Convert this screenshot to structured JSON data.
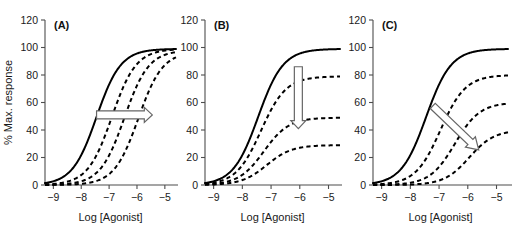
{
  "figure": {
    "background": "#ffffff",
    "curve_color": "#000000",
    "axis_color": "#4d4d4d",
    "arrow_color": "#666666",
    "width": 512,
    "height": 230
  },
  "axes": {
    "ylabel": "% Max. response",
    "xlabel": "Log [Agonist]",
    "yticks": [
      0,
      20,
      40,
      60,
      80,
      100,
      120
    ],
    "xticks": [
      -9,
      -8,
      -7,
      -6,
      -5
    ],
    "xticklabels": [
      "−9",
      "−8",
      "−7",
      "−6",
      "−5"
    ],
    "ylim": [
      0,
      120
    ],
    "xlim": [
      -9.3,
      -4.6
    ],
    "grid": false
  },
  "panels": [
    {
      "label": "(A)",
      "name": "panel-a-competitive-antagonism",
      "show_ylabel": true,
      "arrow": "right",
      "arrow_name": "rightward-shift-arrow"
    },
    {
      "label": "(B)",
      "name": "panel-b-noncompetitive-antagonism",
      "show_ylabel": false,
      "arrow": "down",
      "arrow_name": "downward-depression-arrow"
    },
    {
      "label": "(C)",
      "name": "panel-c-mixed-antagonism",
      "show_ylabel": false,
      "arrow": "diagonal",
      "arrow_name": "diagonal-shift-depression-arrow"
    }
  ],
  "chart_data": {
    "type": "line",
    "title": "",
    "xlabel": "Log [Agonist]",
    "ylabel": "% Max. response",
    "xlim": [
      -9.3,
      -4.6
    ],
    "ylim": [
      0,
      120
    ],
    "xticks": [
      -9,
      -8,
      -7,
      -6,
      -5
    ],
    "yticks": [
      0,
      20,
      40,
      60,
      80,
      100,
      120
    ],
    "grid": false,
    "legend": "none",
    "panels": [
      {
        "panel": "(A)",
        "description": "Parallel rightward shift of concentration-response curves with no change in maximum response",
        "annotation_arrow": "horizontal rightward arrow at 50% response from log -7.5 to log -5.4",
        "series": [
          {
            "name": "control",
            "style": "solid",
            "logEC50": -7.45,
            "emax": 99,
            "hill": 1.0
          },
          {
            "name": "antagonist 1",
            "style": "dashed",
            "logEC50": -6.9,
            "emax": 99,
            "hill": 1.0
          },
          {
            "name": "antagonist 2",
            "style": "dashed",
            "logEC50": -6.45,
            "emax": 98,
            "hill": 1.0
          },
          {
            "name": "antagonist 3",
            "style": "dashed",
            "logEC50": -5.95,
            "emax": 97,
            "hill": 1.0
          }
        ]
      },
      {
        "panel": "(B)",
        "description": "Progressive depression of maximum response with no shift in EC50",
        "annotation_arrow": "vertical downward arrow at log -6 from 86% to 42% response",
        "series": [
          {
            "name": "control",
            "style": "solid",
            "logEC50": -7.45,
            "emax": 99,
            "hill": 1.0
          },
          {
            "name": "antagonist 1",
            "style": "dashed",
            "logEC50": -7.35,
            "emax": 79,
            "hill": 1.0
          },
          {
            "name": "antagonist 2",
            "style": "dashed",
            "logEC50": -7.25,
            "emax": 49,
            "hill": 1.0
          },
          {
            "name": "antagonist 3",
            "style": "dashed",
            "logEC50": -7.15,
            "emax": 29,
            "hill": 1.0
          }
        ]
      },
      {
        "panel": "(C)",
        "description": "Combined rightward shift and depression of maximum response",
        "annotation_arrow": "diagonal arrow from upper-left to lower-right, log -7.2 at 57% to log -5.6 at 26%",
        "series": [
          {
            "name": "control",
            "style": "solid",
            "logEC50": -7.45,
            "emax": 99,
            "hill": 1.0
          },
          {
            "name": "antagonist 1",
            "style": "dashed",
            "logEC50": -6.95,
            "emax": 80,
            "hill": 1.0
          },
          {
            "name": "antagonist 2",
            "style": "dashed",
            "logEC50": -6.45,
            "emax": 60,
            "hill": 1.0
          },
          {
            "name": "antagonist 3",
            "style": "dashed",
            "logEC50": -5.95,
            "emax": 40,
            "hill": 1.0
          }
        ]
      }
    ]
  }
}
